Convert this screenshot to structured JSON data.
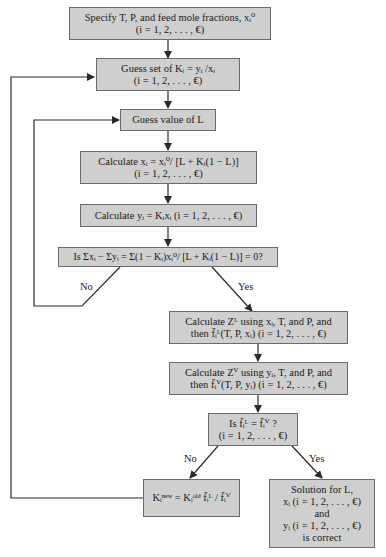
{
  "colors": {
    "box_fill": "#cfcfcf",
    "box_border": "#6b6b6b",
    "line": "#2a2a2a",
    "background": "#ffffff"
  },
  "nodes": [
    {
      "id": "specify",
      "lines": [
        "Specify T, P, and feed mole fractions, xᵢ⁰",
        "(i = 1, 2, . . . , €)"
      ]
    },
    {
      "id": "guess-k",
      "lines": [
        "Guess set of Kᵢ = yᵢ /xᵢ",
        "(i = 1, 2, . . . , €)"
      ]
    },
    {
      "id": "guess-l",
      "lines": [
        "Guess value of L"
      ]
    },
    {
      "id": "calc-x",
      "lines": [
        "Calculate xᵢ = xᵢ⁰/ [L + Kᵢ(1 − L)]",
        "(i = 1, 2, . . . , €)"
      ]
    },
    {
      "id": "calc-y",
      "lines": [
        "Calculate yᵢ = Kᵢxᵢ (i = 1, 2, . . . , €)"
      ]
    },
    {
      "id": "rachford-rice",
      "lines": [
        "Is Σxᵢ − Σyᵢ = Σ(1 − Kᵢ)xᵢ⁰/ [L + Kᵢ(1 − L)] = 0?"
      ]
    },
    {
      "id": "calc-zl",
      "lines": [
        "Calculate Zᴸ using xᵢ, T, and P, and",
        "then f̄ᵢᴸ(T, P, xᵢ)  (i = 1, 2, . . . , €)"
      ]
    },
    {
      "id": "calc-zv",
      "lines": [
        "Calculate Zⱽ using yᵢ, T, and P, and",
        "then f̄ᵢⱽ(T, P, yᵢ)  (i = 1, 2, . . . , €)"
      ]
    },
    {
      "id": "fugacity-check",
      "lines": [
        "Is f̄ᵢᴸ = f̄ᵢⱽ ?",
        "(i = 1, 2, . . . , €)"
      ]
    },
    {
      "id": "update-k",
      "lines": [
        "Kᵢⁿᵉʷ = Kᵢᵒˡᵈ f̄ᵢᴸ / f̄ᵢⱽ"
      ]
    },
    {
      "id": "solution",
      "lines": [
        "Solution for L,",
        "xᵢ (i = 1, 2, . . . , €)",
        "and",
        "yᵢ (i = 1, 2, . . . , €)",
        "is correct"
      ]
    }
  ],
  "edge_labels": {
    "no_1": "No",
    "yes_1": "Yes",
    "no_2": "No",
    "yes_2": "Yes"
  }
}
